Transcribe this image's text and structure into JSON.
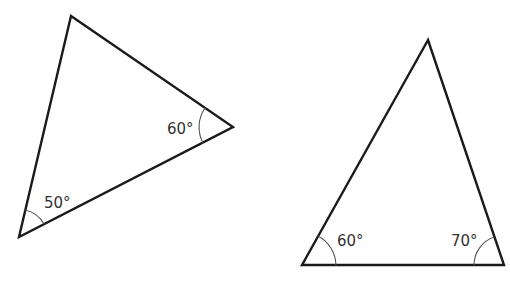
{
  "figure": {
    "type": "two triangles with marked angles",
    "triangles": [
      {
        "id": "triangle-left",
        "vertices": {
          "top": [
            71,
            16
          ],
          "right": [
            233,
            127
          ],
          "bottom_left": [
            19,
            237
          ]
        },
        "angles": [
          {
            "vertex": "right",
            "label": "60°"
          },
          {
            "vertex": "bottom_left",
            "label": "50°"
          }
        ]
      },
      {
        "id": "triangle-right",
        "vertices": {
          "apex": [
            428,
            40
          ],
          "bottom_left": [
            302,
            265
          ],
          "bottom_right": [
            504,
            265
          ]
        },
        "angles": [
          {
            "vertex": "bottom_left",
            "label": "60°"
          },
          {
            "vertex": "bottom_right",
            "label": "70°"
          }
        ]
      }
    ]
  },
  "labels": {
    "left_right_angle": "60°",
    "left_bottom_angle": "50°",
    "right_bottom_left_angle": "60°",
    "right_bottom_right_angle": "70°"
  },
  "colors": {
    "stroke": "#1a1a1a",
    "arc": "#555555",
    "text": "#333333",
    "background": "#ffffff"
  }
}
